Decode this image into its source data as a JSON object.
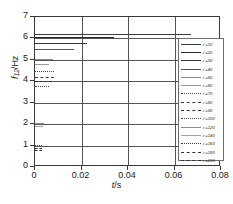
{
  "chart_data": {
    "type": "line",
    "title": "",
    "xlabel": "t /s",
    "xlabel_var": "t",
    "xlabel_unit": "/s",
    "ylabel": "f12/Hz",
    "ylabel_var": "f",
    "ylabel_sub": "12",
    "ylabel_unit": "/Hz",
    "xlim": [
      0,
      0.08
    ],
    "ylim": [
      0,
      7
    ],
    "xticks": [
      "0",
      "0.02",
      "0.04",
      "0.06",
      "0.08"
    ],
    "xtick_values": [
      0,
      0.02,
      0.04,
      0.06,
      0.08
    ],
    "yticks": [
      "0",
      "1",
      "2",
      "3",
      "4",
      "5",
      "6",
      "7"
    ],
    "ytick_values": [
      0,
      1,
      2,
      3,
      4,
      5,
      6,
      7
    ],
    "grid": true,
    "grid_axis": "both",
    "legend_position": "right-inside",
    "series": [
      {
        "name": "t =10",
        "y": 6.2,
        "x_start": 0.0,
        "x_end": 0.067,
        "style": "solid",
        "width": 0.9,
        "color": "#3d3d3d"
      },
      {
        "name": "t =20",
        "y": 6.05,
        "x_start": 0.0,
        "x_end": 0.034,
        "style": "solid",
        "width": 1.7,
        "color": "#2b2b2b"
      },
      {
        "name": "t =30",
        "y": 5.78,
        "x_start": 0.0,
        "x_end": 0.0222,
        "style": "solid",
        "width": 1.4,
        "color": "#333333"
      },
      {
        "name": "t =40",
        "y": 5.5,
        "x_start": 0.0,
        "x_end": 0.0168,
        "style": "solid",
        "width": 1.0,
        "color": "#565656"
      },
      {
        "name": "t =50",
        "y": 5.05,
        "x_start": 0.0,
        "x_end": 0.0078,
        "style": "solid",
        "width": 0.8,
        "color": "#8a8a8a"
      },
      {
        "name": "t =60",
        "y": 4.8,
        "x_start": 0.0,
        "x_end": 0.0062,
        "style": "solid",
        "width": 0.8,
        "color": "#9b9b9b"
      },
      {
        "name": "t =70",
        "y": 4.5,
        "x_start": 0.0,
        "x_end": 0.008,
        "style": "dotted",
        "width": 1.0,
        "color": "#4a4a4a"
      },
      {
        "name": "t =80",
        "y": 4.22,
        "x_start": 0.0,
        "x_end": 0.0082,
        "style": "dashed",
        "width": 1.2,
        "color": "#383838"
      },
      {
        "name": "t =90",
        "y": 4.0,
        "x_start": 0.0,
        "x_end": 0.0074,
        "style": "dashed",
        "width": 1.3,
        "color": "#303030"
      },
      {
        "name": "t =100",
        "y": 3.76,
        "x_start": 0.0,
        "x_end": 0.006,
        "style": "dotted",
        "width": 1.0,
        "color": "#4f4f4f"
      },
      {
        "name": "t =120",
        "y": 2.05,
        "x_start": 0.0,
        "x_end": 0.004,
        "style": "solid",
        "width": 0.8,
        "color": "#8f8f8f"
      },
      {
        "name": "t =140",
        "y": 1.9,
        "x_start": 0.0,
        "x_end": 0.0036,
        "style": "solid",
        "width": 0.8,
        "color": "#a3a3a3"
      },
      {
        "name": "t =160",
        "y": 1.02,
        "x_start": 0.0,
        "x_end": 0.003,
        "style": "dotted",
        "width": 1.1,
        "color": "#3c3c3c"
      },
      {
        "name": "t =180",
        "y": 0.88,
        "x_start": 0.0,
        "x_end": 0.0032,
        "style": "dashed",
        "width": 1.2,
        "color": "#343434"
      },
      {
        "name": "t =200",
        "y": 0.78,
        "x_start": 0.0,
        "x_end": 0.0028,
        "style": "dashed",
        "width": 1.2,
        "color": "#2e2e2e"
      }
    ],
    "legend_entries": [
      {
        "label": "t =10",
        "style": "solid",
        "width": 0.9,
        "color": "#3d3d3d"
      },
      {
        "label": "t =20",
        "style": "solid",
        "width": 1.7,
        "color": "#2b2b2b"
      },
      {
        "label": "t =30",
        "style": "solid",
        "width": 1.4,
        "color": "#333333"
      },
      {
        "label": "t =40",
        "style": "solid",
        "width": 1.0,
        "color": "#565656"
      },
      {
        "label": "t =50",
        "style": "solid",
        "width": 0.8,
        "color": "#8a8a8a"
      },
      {
        "label": "t =60",
        "style": "solid",
        "width": 0.8,
        "color": "#9b9b9b"
      },
      {
        "label": "t =70",
        "style": "dotted",
        "width": 1.0,
        "color": "#4a4a4a"
      },
      {
        "label": "t =80",
        "style": "dashed",
        "width": 1.2,
        "color": "#383838"
      },
      {
        "label": "t =90",
        "style": "dashed",
        "width": 1.3,
        "color": "#303030"
      },
      {
        "label": "t =100",
        "style": "dotted",
        "width": 1.0,
        "color": "#4f4f4f"
      },
      {
        "label": "t =120",
        "style": "solid",
        "width": 0.8,
        "color": "#8f8f8f"
      },
      {
        "label": "t =140",
        "style": "solid",
        "width": 0.8,
        "color": "#a3a3a3"
      },
      {
        "label": "t =160",
        "style": "dotted",
        "width": 1.1,
        "color": "#3c3c3c"
      },
      {
        "label": "t =180",
        "style": "dashed",
        "width": 1.2,
        "color": "#343434"
      },
      {
        "label": "t =200",
        "style": "dashed",
        "width": 1.2,
        "color": "#2e2e2e"
      }
    ]
  },
  "caption": {
    "text": ""
  },
  "colors": {
    "axis": "#3a3a3a",
    "grid": "#545454",
    "background": "#ffffff"
  }
}
